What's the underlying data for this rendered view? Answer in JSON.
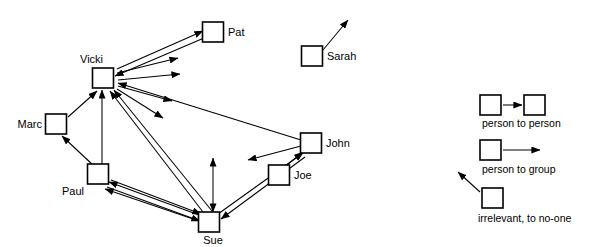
{
  "diagram": {
    "type": "node-link-sociogram",
    "stroke_color": "#000000",
    "background_color": "#ffffff",
    "node_fill": "#ffffff"
  },
  "nodes": [
    {
      "id": "vicki",
      "label": "Vicki",
      "x": 103,
      "y": 78,
      "w": 21,
      "h": 20,
      "label_x": 80,
      "label_y": 60,
      "label_anchor": "start"
    },
    {
      "id": "pat",
      "label": "Pat",
      "x": 213,
      "y": 32,
      "w": 21,
      "h": 20,
      "label_x": 228,
      "label_y": 33,
      "label_anchor": "start"
    },
    {
      "id": "sarah",
      "label": "Sarah",
      "x": 312,
      "y": 56,
      "w": 21,
      "h": 20,
      "label_x": 327,
      "label_y": 57,
      "label_anchor": "start"
    },
    {
      "id": "marc",
      "label": "Marc",
      "x": 56,
      "y": 124,
      "w": 21,
      "h": 20,
      "label_x": 42,
      "label_y": 125,
      "label_anchor": "end"
    },
    {
      "id": "john",
      "label": "John",
      "x": 311,
      "y": 143,
      "w": 21,
      "h": 20,
      "label_x": 326,
      "label_y": 144,
      "label_anchor": "start"
    },
    {
      "id": "joe",
      "label": "Joe",
      "x": 279,
      "y": 175,
      "w": 21,
      "h": 20,
      "label_x": 294,
      "label_y": 176,
      "label_anchor": "start"
    },
    {
      "id": "paul",
      "label": "Paul",
      "x": 98,
      "y": 174,
      "w": 21,
      "h": 20,
      "label_x": 84,
      "label_y": 192,
      "label_anchor": "end"
    },
    {
      "id": "sue",
      "label": "Sue",
      "x": 209,
      "y": 222,
      "w": 21,
      "h": 20,
      "label_x": 213,
      "label_y": 241,
      "label_anchor": "middle"
    }
  ],
  "edges": [
    {
      "id": "vicki-pat",
      "from": "vicki",
      "to": "pat",
      "kind": "person-to-person",
      "x1": 117,
      "y1": 69,
      "x2": 203,
      "y2": 31,
      "arrow_at": "end"
    },
    {
      "id": "pat-vicki",
      "from": "pat",
      "to": "vicki",
      "kind": "person-to-person",
      "x1": 204,
      "y1": 38,
      "x2": 115,
      "y2": 76,
      "arrow_at": "end"
    },
    {
      "id": "vicki-group-1",
      "from": "vicki",
      "to": "group",
      "kind": "person-to-group",
      "x1": 117,
      "y1": 73,
      "x2": 178,
      "y2": 58,
      "arrow_at": "end"
    },
    {
      "id": "vicki-group-2",
      "from": "vicki",
      "to": "group",
      "kind": "person-to-group",
      "x1": 118,
      "y1": 80,
      "x2": 180,
      "y2": 74,
      "arrow_at": "end"
    },
    {
      "id": "vicki-group-3",
      "from": "vicki",
      "to": "group",
      "kind": "person-to-group",
      "x1": 118,
      "y1": 86,
      "x2": 172,
      "y2": 101,
      "arrow_at": "end"
    },
    {
      "id": "vicki-group-4",
      "from": "vicki",
      "to": "group",
      "kind": "person-to-group",
      "x1": 117,
      "y1": 89,
      "x2": 163,
      "y2": 118,
      "arrow_at": "end"
    },
    {
      "id": "john-vicki",
      "from": "john",
      "to": "vicki",
      "kind": "person-to-person",
      "x1": 301,
      "y1": 140,
      "x2": 118,
      "y2": 83,
      "arrow_at": "end"
    },
    {
      "id": "john-group",
      "from": "john",
      "to": "group",
      "kind": "person-to-group",
      "x1": 301,
      "y1": 146,
      "x2": 248,
      "y2": 160,
      "arrow_at": "end"
    },
    {
      "id": "marc-vicki",
      "from": "marc",
      "to": "vicki",
      "kind": "person-to-person",
      "x1": 68,
      "y1": 117,
      "x2": 97,
      "y2": 91,
      "arrow_at": "end"
    },
    {
      "id": "paul-marc",
      "from": "paul",
      "to": "marc",
      "kind": "person-to-person",
      "x1": 93,
      "y1": 165,
      "x2": 62,
      "y2": 136,
      "arrow_at": "end"
    },
    {
      "id": "paul-vicki",
      "from": "paul",
      "to": "vicki",
      "kind": "person-to-person",
      "x1": 102,
      "y1": 164,
      "x2": 102,
      "y2": 90,
      "arrow_at": "end"
    },
    {
      "id": "sue-vicki-a",
      "from": "sue",
      "to": "vicki",
      "kind": "person-to-person",
      "x1": 203,
      "y1": 212,
      "x2": 110,
      "y2": 91,
      "arrow_at": "end"
    },
    {
      "id": "sue-vicki-b",
      "from": "sue",
      "to": "vicki",
      "kind": "person-to-person",
      "x1": 212,
      "y1": 211,
      "x2": 114,
      "y2": 90,
      "arrow_at": "end"
    },
    {
      "id": "paul-sue-1",
      "from": "sue",
      "to": "paul",
      "kind": "person-to-person",
      "x1": 199,
      "y1": 215,
      "x2": 109,
      "y2": 182,
      "arrow_at": "end"
    },
    {
      "id": "paul-sue-2",
      "from": "sue",
      "to": "paul",
      "kind": "person-to-person",
      "x1": 199,
      "y1": 221,
      "x2": 105,
      "y2": 189,
      "arrow_at": "end"
    },
    {
      "id": "paul-sue-3",
      "from": "paul",
      "to": "sue",
      "kind": "person-to-person",
      "x1": 111,
      "y1": 180,
      "x2": 201,
      "y2": 214,
      "arrow_at": "end"
    },
    {
      "id": "paul-sue-4",
      "from": "paul",
      "to": "sue",
      "kind": "person-to-person",
      "x1": 107,
      "y1": 187,
      "x2": 200,
      "y2": 221,
      "arrow_at": "end"
    },
    {
      "id": "sue-up",
      "from": "sue",
      "to": "group",
      "kind": "person-to-group",
      "x1": 213,
      "y1": 212,
      "x2": 213,
      "y2": 158,
      "arrow_at": "both"
    },
    {
      "id": "sue-john",
      "from": "sue",
      "to": "john",
      "kind": "person-to-person",
      "x1": 218,
      "y1": 214,
      "x2": 303,
      "y2": 153,
      "arrow_at": "end"
    },
    {
      "id": "john-sue",
      "from": "john",
      "to": "sue",
      "kind": "person-to-person",
      "x1": 305,
      "y1": 157,
      "x2": 221,
      "y2": 219,
      "arrow_at": "end"
    },
    {
      "id": "joe-john",
      "from": "joe",
      "to": "john",
      "kind": "person-to-person",
      "x1": 277,
      "y1": 173,
      "x2": 303,
      "y2": 152,
      "arrow_at": "end"
    },
    {
      "id": "sarah-none",
      "from": "sarah",
      "to": "none",
      "kind": "irrelevant",
      "x1": 323,
      "y1": 50,
      "x2": 348,
      "y2": 20,
      "arrow_at": "end"
    }
  ],
  "legend": {
    "items": [
      {
        "id": "person-to-person",
        "label": "person to person",
        "box1": {
          "x": 480,
          "y": 95,
          "w": 21,
          "h": 20
        },
        "box2": {
          "x": 524,
          "y": 95,
          "w": 21,
          "h": 20
        },
        "arrow": {
          "x1": 503,
          "y1": 105,
          "x2": 522,
          "y2": 105
        },
        "label_x": 482,
        "label_y": 124
      },
      {
        "id": "person-to-group",
        "label": "person to group",
        "box1": {
          "x": 480,
          "y": 140,
          "w": 21,
          "h": 20
        },
        "arrow": {
          "x1": 503,
          "y1": 150,
          "x2": 540,
          "y2": 150
        },
        "label_x": 482,
        "label_y": 170
      },
      {
        "id": "irrelevant",
        "label": "irrelevant, to no-one",
        "box1": {
          "x": 482,
          "y": 188,
          "w": 21,
          "h": 20
        },
        "arrow": {
          "x1": 480,
          "y1": 192,
          "x2": 458,
          "y2": 172
        },
        "label_x": 478,
        "label_y": 219
      }
    ]
  }
}
